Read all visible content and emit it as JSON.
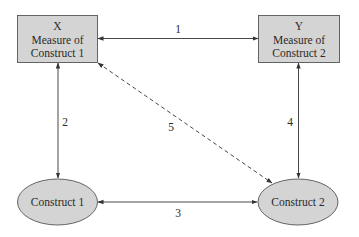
{
  "diagram": {
    "nodes": {
      "x_box": {
        "shape": "rectangle",
        "line1": "X",
        "line2": "Measure of",
        "line3": "Construct 1"
      },
      "y_box": {
        "shape": "rectangle",
        "line1": "Y",
        "line2": "Measure of",
        "line3": "Construct 2"
      },
      "construct1": {
        "shape": "ellipse",
        "label": "Construct 1"
      },
      "construct2": {
        "shape": "ellipse",
        "label": "Construct 2"
      }
    },
    "edges": [
      {
        "id": "1",
        "label": "1",
        "from": "X",
        "to": "Y",
        "style": "solid",
        "direction": "bidirectional"
      },
      {
        "id": "2",
        "label": "2",
        "from": "X",
        "to": "Construct 1",
        "style": "solid",
        "direction": "bidirectional"
      },
      {
        "id": "3",
        "label": "3",
        "from": "Construct 1",
        "to": "Construct 2",
        "style": "solid",
        "direction": "bidirectional"
      },
      {
        "id": "4",
        "label": "4",
        "from": "Y",
        "to": "Construct 2",
        "style": "solid",
        "direction": "bidirectional"
      },
      {
        "id": "5",
        "label": "5",
        "from": "X",
        "to": "Construct 2",
        "style": "dashed",
        "direction": "bidirectional"
      }
    ],
    "colors": {
      "node_fill": "#d4d4d4",
      "node_stroke": "#555555",
      "edge_stroke": "#333333",
      "text": "#2a2a2a"
    }
  }
}
